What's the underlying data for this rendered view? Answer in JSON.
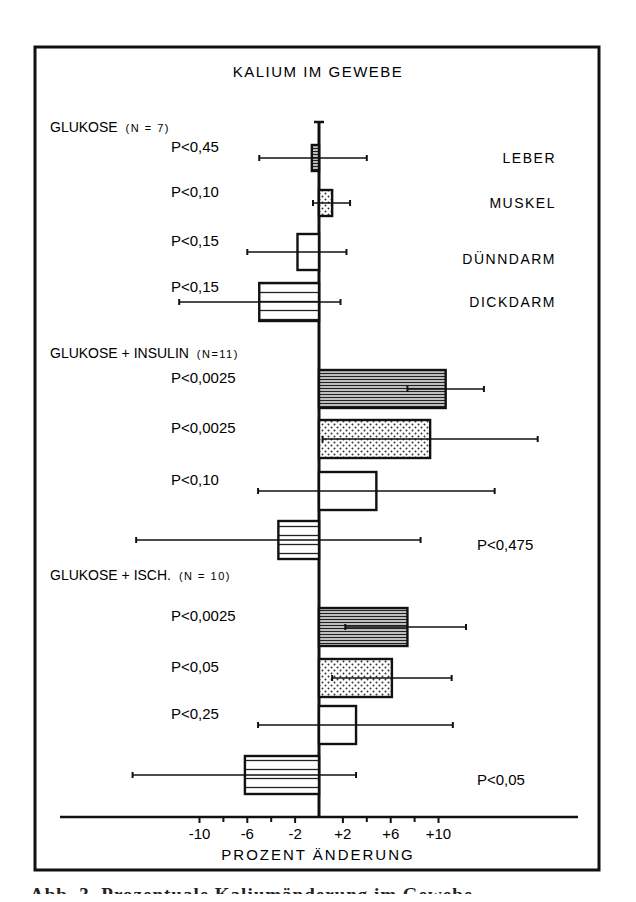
{
  "chart_data": {
    "type": "bar",
    "orientation": "horizontal",
    "title": "KALIUM IM GEWEBE",
    "xlabel": "PROZENT ÄNDERUNG",
    "ylabel": "",
    "xlim": [
      -14,
      18
    ],
    "x_ticks": [
      -10,
      -6,
      -2,
      2,
      6,
      10
    ],
    "x_tick_labels": [
      "-10",
      "-6",
      "-2",
      "+2",
      "+6",
      "+10"
    ],
    "x_minor_ticks": [
      -8,
      -4,
      0,
      4,
      8
    ],
    "grid": false,
    "legend": {
      "position": "right-labels",
      "entries": [
        {
          "label": "LEBER",
          "pattern": "fine-horizontal-lines"
        },
        {
          "label": "MUSKEL",
          "pattern": "dots"
        },
        {
          "label": "DÜNNDARM",
          "pattern": "open"
        },
        {
          "label": "DICKDARM",
          "pattern": "coarse-horizontal-lines"
        }
      ]
    },
    "categories": [
      "LEBER",
      "MUSKEL",
      "DÜNNDARM",
      "DICKDARM"
    ],
    "groups": [
      {
        "name": "GLUKOSE",
        "n_label": "(N = 7)",
        "bars": [
          {
            "tissue": "LEBER",
            "value": -0.6,
            "err_low": -5.0,
            "err_high": 4.0,
            "p": "P<0,45"
          },
          {
            "tissue": "MUSKEL",
            "value": 1.1,
            "err_low": -0.5,
            "err_high": 2.6,
            "p": "P<0,10"
          },
          {
            "tissue": "DÜNNDARM",
            "value": -1.8,
            "err_low": -6.0,
            "err_high": 2.3,
            "p": "P<0,15"
          },
          {
            "tissue": "DICKDARM",
            "value": -5.0,
            "err_low": -11.7,
            "err_high": 1.8,
            "p": "P<0,15"
          }
        ]
      },
      {
        "name": "GLUKOSE + INSULIN",
        "n_label": "(N=11)",
        "bars": [
          {
            "tissue": "LEBER",
            "value": 10.6,
            "err_low": 7.4,
            "err_high": 13.8,
            "p": "P<0,0025"
          },
          {
            "tissue": "MUSKEL",
            "value": 9.3,
            "err_low": 0.3,
            "err_high": 18.3,
            "p": "P<0,0025"
          },
          {
            "tissue": "DÜNNDARM",
            "value": 4.8,
            "err_low": -5.1,
            "err_high": 14.7,
            "p": "P<0,10"
          },
          {
            "tissue": "DICKDARM",
            "value": -3.4,
            "err_low": -15.3,
            "err_high": 8.5,
            "p": "P<0,475"
          }
        ]
      },
      {
        "name": "GLUKOSE + ISCH.",
        "n_label": "(N = 10)",
        "bars": [
          {
            "tissue": "LEBER",
            "value": 7.4,
            "err_low": 2.2,
            "err_high": 12.3,
            "p": "P<0,0025"
          },
          {
            "tissue": "MUSKEL",
            "value": 6.1,
            "err_low": 1.1,
            "err_high": 11.1,
            "p": "P<0,05"
          },
          {
            "tissue": "DÜNNDARM",
            "value": 3.1,
            "err_low": -5.1,
            "err_high": 11.2,
            "p": "P<0,25"
          },
          {
            "tissue": "DICKDARM",
            "value": -6.2,
            "err_low": -15.6,
            "err_high": 3.1,
            "p": "P<0,05"
          }
        ]
      }
    ]
  },
  "caption_partial": "Abb. 3. Prozentuale Kaliumänderung im Gewebe"
}
